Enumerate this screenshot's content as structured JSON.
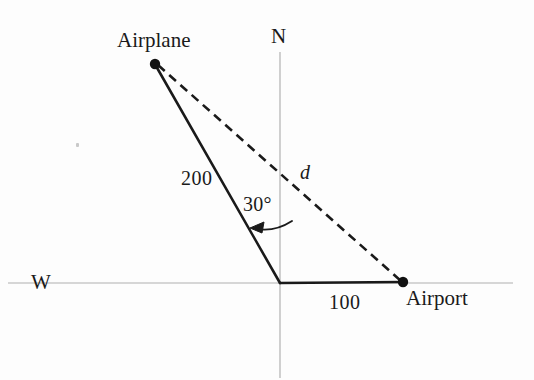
{
  "figure": {
    "background_color": "#fdfdfd",
    "ink_color": "#1a1a1a",
    "axis_color": "#bdbdbd",
    "labels": {
      "airplane": "Airplane",
      "airport": "Airport",
      "north": "N",
      "west": "W",
      "side_plane_to_origin": "200",
      "side_origin_to_airport": "100",
      "angle": "30°",
      "distance": "d"
    },
    "points": {
      "airplane": {
        "x": 155,
        "y": 64
      },
      "origin": {
        "x": 280,
        "y": 283
      },
      "airport": {
        "x": 403,
        "y": 282
      }
    },
    "segments": [
      {
        "name": "plane-to-origin",
        "style": "solid",
        "measure": "200"
      },
      {
        "name": "origin-to-airport",
        "style": "solid",
        "measure": "100"
      },
      {
        "name": "plane-to-airport",
        "style": "dashed",
        "measure": "d"
      }
    ],
    "axes": {
      "vertical_label": "N",
      "horizontal_label": "W",
      "style": "light-gray-thin"
    },
    "angle_marker": {
      "value": "30°",
      "between": [
        "north-axis",
        "plane-to-origin"
      ],
      "arrow": "curved-arrow-pointing-left"
    }
  }
}
